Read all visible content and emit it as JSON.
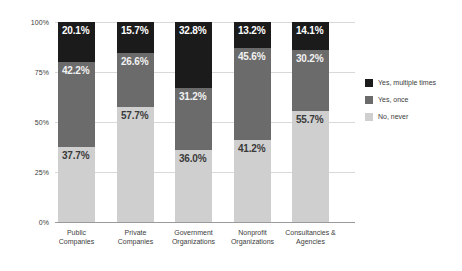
{
  "chart_data": {
    "type": "bar",
    "subtype": "stacked-bar-100",
    "title": "",
    "xlabel": "",
    "ylabel": "",
    "ylim": [
      0,
      100
    ],
    "ytick_labels": [
      "0%",
      "25%",
      "50%",
      "75%",
      "100%"
    ],
    "ytick_values": [
      0,
      25,
      50,
      75,
      100
    ],
    "grid": true,
    "legend_position": "right",
    "categories": [
      "Public Companies",
      "Private Companies",
      "Government Organizations",
      "Nonprofit Organizations",
      "Consultancies & Agencies"
    ],
    "category_lines": [
      [
        "Public",
        "Companies"
      ],
      [
        "Private",
        "Companies"
      ],
      [
        "Government",
        "Organizations"
      ],
      [
        "Nonprofit",
        "Organizations"
      ],
      [
        "Consultancies &",
        "Agencies"
      ]
    ],
    "series": [
      {
        "name": "Yes, multiple times",
        "color": "#1b1b1b",
        "values": [
          20.1,
          15.7,
          32.8,
          13.2,
          14.1
        ],
        "labels": [
          "20.1%",
          "15.7%",
          "32.8%",
          "13.2%",
          "14.1%"
        ]
      },
      {
        "name": "Yes, once",
        "color": "#6b6b6b",
        "values": [
          42.2,
          26.6,
          31.2,
          45.6,
          30.2
        ],
        "labels": [
          "42.2%",
          "26.6%",
          "31.2%",
          "45.6%",
          "30.2%"
        ]
      },
      {
        "name": "No, never",
        "color": "#cfcfcf",
        "values": [
          37.7,
          57.7,
          36.0,
          41.2,
          55.7
        ],
        "labels": [
          "37.7%",
          "57.7%",
          "36.0%",
          "41.2%",
          "55.7%"
        ]
      }
    ]
  },
  "legend": {
    "items": [
      {
        "label": "Yes, multiple times",
        "color": "#1b1b1b"
      },
      {
        "label": "Yes, once",
        "color": "#6b6b6b"
      },
      {
        "label": "No, never",
        "color": "#cfcfcf"
      }
    ]
  },
  "axes": {
    "y_ticks": [
      {
        "label": "100%",
        "value": 100
      },
      {
        "label": "75%",
        "value": 75
      },
      {
        "label": "50%",
        "value": 50
      },
      {
        "label": "25%",
        "value": 25
      },
      {
        "label": "0%",
        "value": 0
      }
    ]
  }
}
